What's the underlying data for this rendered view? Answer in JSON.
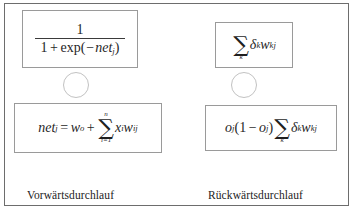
{
  "figure": {
    "frame_color": "#6d6d6d",
    "box_border_color": "#9a9a9a",
    "circle_border_color": "#c2c2c2",
    "background": "#ffffff",
    "text_color": "#232323"
  },
  "forward": {
    "caption": "Vorwärtsdurchlauf",
    "activation_formula": {
      "description": "Sigmoid-Aktivierungsfunktion",
      "numerator": "1",
      "denominator_prefix": "1",
      "denominator_operator": "+",
      "denominator_function": "exp",
      "denominator_open_paren": "(",
      "denominator_minus": "−",
      "denominator_variable": "net",
      "denominator_subscript": "j",
      "denominator_close_paren": ")",
      "plain_text": "1 / (1 + exp(-net_j))"
    },
    "net_formula": {
      "description": "Netzeingabe",
      "lhs_variable": "net",
      "lhs_subscript": "j",
      "equals": "=",
      "bias_variable": "w",
      "bias_subscript": "o",
      "operator": "+",
      "sum_sign": "∑",
      "sum_lower": "i=1",
      "sum_upper": "n",
      "term_x": "x",
      "term_x_subscript": "i",
      "term_w": "w",
      "term_w_subscript": "ij",
      "plain_text": "net_j = w_o + sum_{i=1}^{n} x_i w_ij"
    }
  },
  "backward": {
    "caption": "Rückwärtsdurchlauf",
    "delta_sum_formula": {
      "description": "Gewichtete Fehlersumme der Nachfolgeschicht",
      "sum_sign": "∑",
      "sum_lower": "k",
      "delta": "δ",
      "delta_subscript": "k",
      "weight": "w",
      "weight_subscript": "kj",
      "plain_text": "sum_k delta_k w_kj"
    },
    "error_formula": {
      "description": "Fehlersignal eines verdeckten Neurons",
      "o_variable": "o",
      "o_subscript": "j",
      "open_paren": "(",
      "one": "1",
      "minus": "−",
      "o_variable_2": "o",
      "o_subscript_2": "j",
      "close_paren": ")",
      "sum_sign": "∑",
      "sum_lower": "k",
      "delta": "δ",
      "delta_subscript": "k",
      "weight": "w",
      "weight_subscript": "kj",
      "plain_text": "o_j (1 - o_j) sum_k delta_k w_kj"
    }
  },
  "neurons": {
    "forward_label": "",
    "backward_label": ""
  }
}
